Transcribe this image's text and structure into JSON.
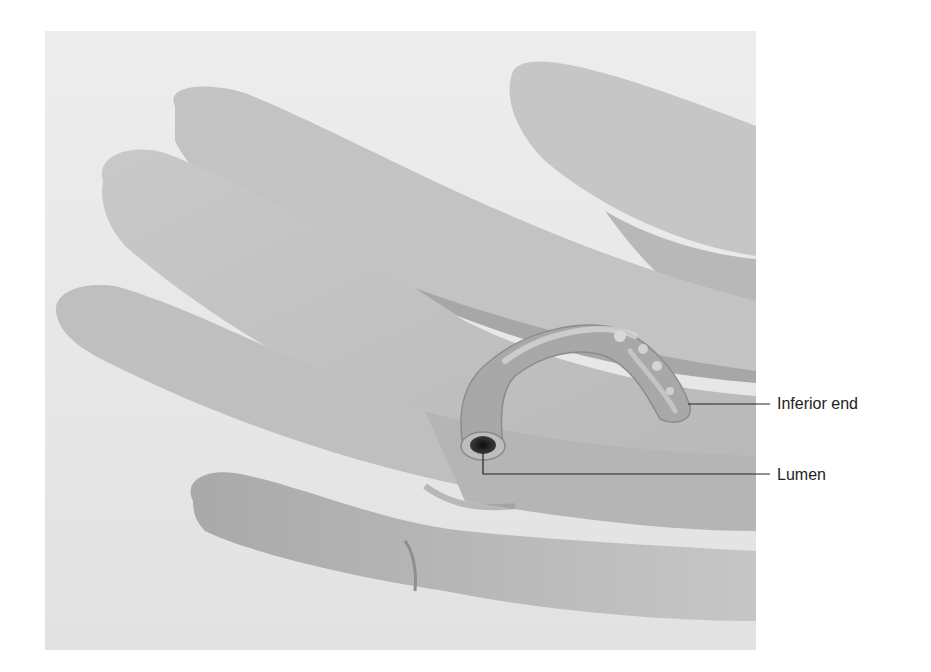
{
  "figure": {
    "labels": [
      {
        "text": "Inferior end"
      },
      {
        "text": "Lumen"
      }
    ]
  },
  "colors": {
    "background": "#e9e9e9",
    "glove_light": "#cfcfcf",
    "glove_mid": "#b3b3b3",
    "glove_shadow": "#8f8f8f",
    "specimen": "#a9a9a9",
    "specimen_highlight": "#d6d6d6",
    "lumen": "#1e1e1e",
    "leader_line": "#222222"
  }
}
